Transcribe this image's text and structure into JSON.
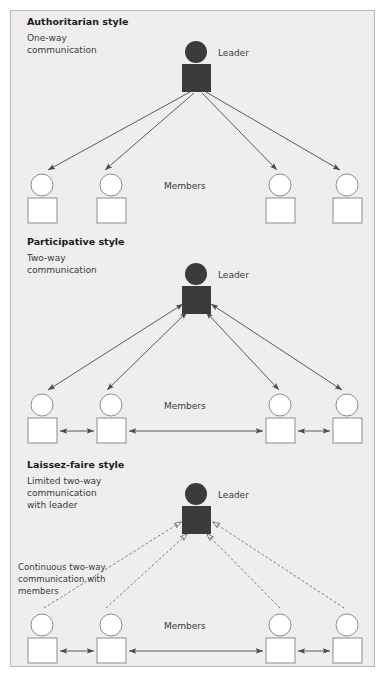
{
  "figure": {
    "background": "#eeeeee",
    "border_color": "#b8b8b8",
    "leader_color": "#3b3b3b",
    "member_fill": "#ffffff",
    "member_stroke": "#8c8c8c",
    "line_color": "#4a4a4a",
    "dashed_line_color": "#6e6e6e"
  },
  "sections": [
    {
      "id": "authoritarian",
      "title": "Authoritarian style",
      "subtitle_lines": [
        "One-way",
        "communication"
      ],
      "leader_label": "Leader",
      "members_label": "Members",
      "arrow_style": "solid",
      "arrow_direction": "leader-to-members",
      "member_links": false,
      "annotation_lines": []
    },
    {
      "id": "participative",
      "title": "Participative style",
      "subtitle_lines": [
        "Two-way",
        "communication"
      ],
      "leader_label": "Leader",
      "members_label": "Members",
      "arrow_style": "solid",
      "arrow_direction": "two-way",
      "member_links": true,
      "annotation_lines": []
    },
    {
      "id": "laissez-faire",
      "title": "Laissez-faire style",
      "subtitle_lines": [
        "Limited two-way",
        "communication",
        "with leader"
      ],
      "leader_label": "Leader",
      "members_label": "Members",
      "arrow_style": "dashed",
      "arrow_direction": "members-to-leader",
      "member_links": true,
      "annotation_lines": [
        "Continuous two-way",
        "communication with",
        "members"
      ]
    }
  ]
}
